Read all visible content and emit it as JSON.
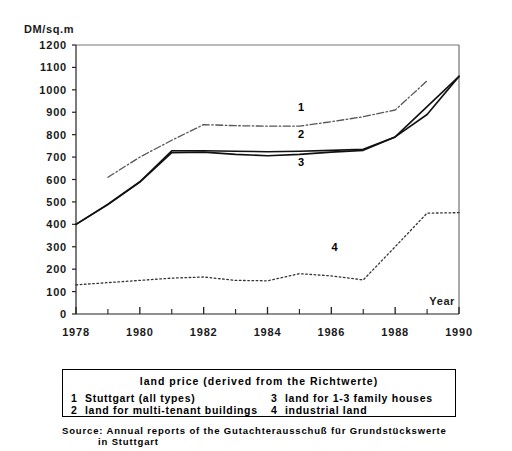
{
  "chart_data": {
    "type": "line",
    "title": "",
    "xlabel": "Year",
    "ylabel": "DM/sq.m",
    "xlim": [
      1978,
      1990
    ],
    "ylim": [
      0,
      1200
    ],
    "grid": false,
    "legend_position": "below-plot",
    "x_tick_labels": [
      "1978",
      "1980",
      "1982",
      "1984",
      "1986",
      "1988",
      "1990"
    ],
    "x_tick_values": [
      1978,
      1980,
      1982,
      1984,
      1986,
      1988,
      1990
    ],
    "x_minor_ticks": [
      1979,
      1981,
      1983,
      1985,
      1987,
      1989
    ],
    "y_tick_labels": [
      "0",
      "100",
      "200",
      "300",
      "400",
      "500",
      "600",
      "700",
      "800",
      "900",
      "1000",
      "1100",
      "1200"
    ],
    "y_tick_values": [
      0,
      100,
      200,
      300,
      400,
      500,
      600,
      700,
      800,
      900,
      1000,
      1100,
      1200
    ],
    "annotations": [
      {
        "text": "1",
        "x": 1985.05,
        "y": 905
      },
      {
        "text": "2",
        "x": 1985.05,
        "y": 785
      },
      {
        "text": "3",
        "x": 1985.05,
        "y": 660
      },
      {
        "text": "4",
        "x": 1986.1,
        "y": 282
      }
    ],
    "series": [
      {
        "name": "Stuttgart (all types)",
        "key": "1",
        "style": "dash-dot",
        "color": "#555555",
        "x": [
          1979,
          1980,
          1981,
          1982,
          1983,
          1984,
          1985,
          1986,
          1987,
          1988,
          1989
        ],
        "values": [
          610,
          700,
          775,
          845,
          840,
          838,
          838,
          858,
          880,
          910,
          1040
        ]
      },
      {
        "name": "land for multi-tenant buildings",
        "key": "2",
        "style": "solid",
        "color": "#111111",
        "x": [
          1978,
          1979,
          1980,
          1981,
          1982,
          1983,
          1984,
          1985,
          1986,
          1987,
          1988,
          1989,
          1990
        ],
        "values": [
          400,
          490,
          590,
          728,
          728,
          726,
          724,
          726,
          730,
          735,
          790,
          925,
          1060
        ]
      },
      {
        "name": "land for 1-3 family houses",
        "key": "3",
        "style": "solid",
        "color": "#111111",
        "x": [
          1978,
          1979,
          1980,
          1981,
          1982,
          1983,
          1984,
          1985,
          1986,
          1987,
          1988,
          1989,
          1990
        ],
        "values": [
          400,
          488,
          588,
          720,
          722,
          712,
          706,
          712,
          722,
          730,
          790,
          890,
          1060
        ]
      },
      {
        "name": "industrial land",
        "key": "4",
        "style": "dotted",
        "color": "#333333",
        "x": [
          1978,
          1979,
          1980,
          1981,
          1982,
          1983,
          1984,
          1985,
          1986,
          1987,
          1988,
          1989,
          1990
        ],
        "values": [
          130,
          140,
          150,
          160,
          165,
          150,
          148,
          180,
          170,
          152,
          300,
          450,
          452
        ]
      }
    ]
  },
  "axes": {
    "y_title": "DM/sq.m",
    "x_title": "Year"
  },
  "legend": {
    "title": "land price (derived from the Richtwerte)",
    "entries": [
      {
        "key": "1",
        "label": "Stuttgart (all types)"
      },
      {
        "key": "3",
        "label": "land for 1-3 family houses"
      },
      {
        "key": "2",
        "label": "land for multi-tenant buildings"
      },
      {
        "key": "4",
        "label": "industrial land"
      }
    ]
  },
  "source": {
    "line1": "Source: Annual reports of the Gutachterausschuß für Grundstückswerte",
    "line2": "in Stuttgart"
  }
}
